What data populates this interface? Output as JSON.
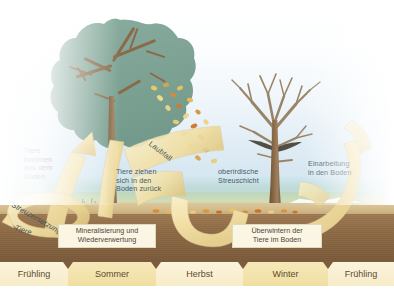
{
  "figure": {
    "type": "ecology-cycle-diagram",
    "colors": {
      "sky": "#dceaf3",
      "canopy": "#7fa394",
      "trunk": "#8a6a49",
      "soil": "#8d6a45",
      "topsoil": "#d2b887",
      "arrow": "#f3e2ab",
      "label_box": "#fbf6e4",
      "label_text": "#4a5a63",
      "season_light": "#f7ecc9",
      "season_dark": "#f0dfa2"
    }
  },
  "labels": {
    "animals_emerge": "Tiere\nkommen\naus dem\nBoden",
    "litter_decomposition": "Streuzersetzung",
    "animals_ribbon": "Tiere",
    "mineralisation": "Mineralisierung und\nWiederverwertung",
    "leaf_fall": "Laubfall",
    "animals_retreat": "Tiere ziehen\nsich in den\nBoden zurück",
    "litter_layer": "oberirdische\nStreuschicht",
    "overwintering": "Überwintern der\nTiere im Boden",
    "incorporation": "Einarbeitung\nin den Boden"
  },
  "seasons": [
    {
      "name": "Frühling",
      "left": 0,
      "width": 68,
      "shade": "light"
    },
    {
      "name": "Sommer",
      "left": 68,
      "width": 88,
      "shade": "dark"
    },
    {
      "name": "Herbst",
      "left": 156,
      "width": 87,
      "shade": "light"
    },
    {
      "name": "Winter",
      "left": 243,
      "width": 85,
      "shade": "dark"
    },
    {
      "name": "Frühling",
      "left": 328,
      "width": 66,
      "shade": "light"
    }
  ],
  "trees": [
    {
      "id": "summer-tree",
      "state": "belaubt",
      "season": "Sommer"
    },
    {
      "id": "winter-tree",
      "state": "kahl",
      "season": "Winter"
    }
  ]
}
